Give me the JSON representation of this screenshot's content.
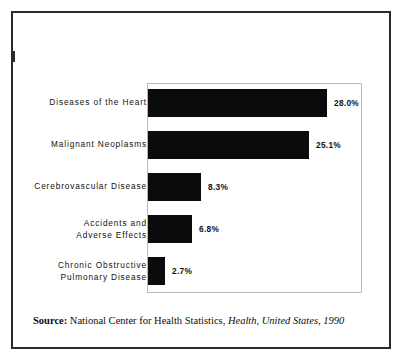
{
  "figure": {
    "background_color": "#ffffff",
    "border_color": "#2a2a2a",
    "bar_color": "#0b0b0b",
    "plot_border_color": "#b9b9b9"
  },
  "chart_data": {
    "type": "bar",
    "orientation": "horizontal",
    "title": "",
    "subtitle": "",
    "xlabel": "",
    "ylabel": "",
    "grid": false,
    "legend": null,
    "xlim": [
      0,
      33.4
    ],
    "value_suffix": "%",
    "categories": [
      "Diseases of the Heart",
      "Malignant Neoplasms",
      "Cerebrovascular Disease",
      "Accidents and\nAdverse Effects",
      "Chronic Obstructive\nPulmonary Disease"
    ],
    "values": [
      28.0,
      25.1,
      8.3,
      6.8,
      2.7
    ],
    "value_labels": [
      "28.0%",
      "25.1%",
      "8.3%",
      "6.8%",
      "2.7%"
    ],
    "bars": [
      {
        "label": "Diseases of the Heart",
        "value": 28.0,
        "value_label": "28.0%"
      },
      {
        "label": "Malignant Neoplasms",
        "value": 25.1,
        "value_label": "25.1%"
      },
      {
        "label": "Cerebrovascular Disease",
        "value": 8.3,
        "value_label": "8.3%"
      },
      {
        "label": "Accidents and\nAdverse Effects",
        "value": 6.8,
        "value_label": "6.8%"
      },
      {
        "label": "Chronic Obstructive\nPulmonary Disease",
        "value": 2.7,
        "value_label": "2.7%"
      }
    ]
  },
  "source": {
    "label": "Source:",
    "agency": "National Center for Health Statistics,",
    "publication": "Health, United States, 1990"
  }
}
